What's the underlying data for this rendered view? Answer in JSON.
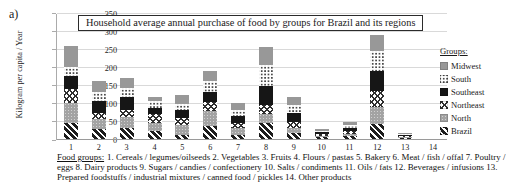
{
  "figure_label": "a)",
  "colors": {
    "black": "#161616",
    "gray": "#989898",
    "gridline": "#d9d9d9",
    "axis": "#9a9a9a",
    "background": "#ffffff"
  },
  "chart_data": {
    "type": "bar",
    "subtype": "stacked-vertical",
    "title": "Household average annual purchase of food by groups for Brazil and its regions",
    "xlabel": "",
    "ylabel": "Kilogram per capita / Year",
    "ylim": [
      0,
      350
    ],
    "yticks": [
      0,
      50,
      100,
      150,
      200,
      250,
      300,
      350
    ],
    "grid": true,
    "categories": [
      "1",
      "2",
      "3",
      "4",
      "5",
      "6",
      "7",
      "8",
      "9",
      "10",
      "11",
      "12",
      "13",
      "14"
    ],
    "stack_order_bottom_to_top": [
      "Brazil",
      "North",
      "Northeast",
      "Southeast",
      "South",
      "Midwest"
    ],
    "series": [
      {
        "name": "Brazil",
        "pattern": "diagonal-stripes",
        "values": [
          44,
          28,
          31,
          21,
          12,
          35,
          12,
          44,
          16,
          5,
          7,
          42,
          3,
          0
        ]
      },
      {
        "name": "North",
        "pattern": "gray-fine-dots",
        "values": [
          56,
          28,
          29,
          23,
          27,
          42,
          19,
          25,
          14,
          4,
          8,
          46,
          2,
          0
        ]
      },
      {
        "name": "Northeast",
        "pattern": "diamond-crosshatch",
        "values": [
          39,
          16,
          21,
          26,
          20,
          25,
          13,
          26,
          16,
          5,
          7,
          46,
          3,
          0
        ]
      },
      {
        "name": "Southeast",
        "pattern": "solid-black",
        "values": [
          35,
          34,
          35,
          16,
          21,
          29,
          19,
          53,
          27,
          5,
          9,
          56,
          4,
          0
        ]
      },
      {
        "name": "South",
        "pattern": "white-dots",
        "values": [
          25,
          26,
          26,
          19,
          18,
          29,
          18,
          58,
          22,
          4,
          8,
          55,
          3,
          0
        ]
      },
      {
        "name": "Midwest",
        "pattern": "solid-gray",
        "values": [
          60,
          30,
          27,
          11,
          24,
          28,
          19,
          49,
          21,
          5,
          8,
          43,
          3,
          0
        ]
      }
    ],
    "legend": {
      "heading": "Groups:",
      "position": "right",
      "items": [
        {
          "name": "Midwest",
          "pattern": "solid-gray"
        },
        {
          "name": "South",
          "pattern": "white-dots"
        },
        {
          "name": "Southeast",
          "pattern": "solid-black"
        },
        {
          "name": "Northeast",
          "pattern": "diamond-crosshatch"
        },
        {
          "name": "North",
          "pattern": "gray-fine-dots"
        },
        {
          "name": "Brazil",
          "pattern": "diagonal-stripes"
        }
      ]
    }
  },
  "footnote": {
    "heading": "Food groups:",
    "text": "1. Cereals / legumes/oilseeds 2. Vegetables 3. Fruits 4. Flours / pastas 5. Bakery 6. Meat / fish / offal 7. Poultry / eggs 8. Dairy products 9. Sugars / candies / confectionery 10. Salts / condiments 11. Oils / fats 12. Beverages / infusions 13. Prepared foodstuffs / industrial mixtures / canned food / pickles 14. Other products"
  }
}
